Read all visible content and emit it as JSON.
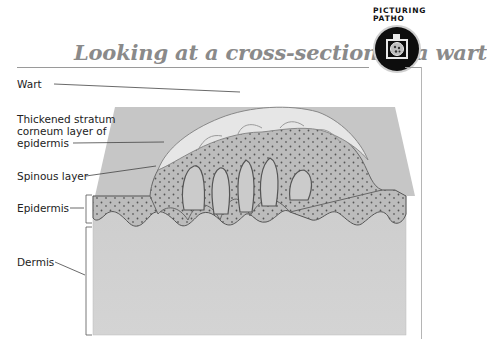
{
  "header": {
    "brand_line1": "PICTURING",
    "brand_line2": "PATHO",
    "title": "Looking at a cross-section of a wart",
    "badge_icon": "camera-icon"
  },
  "figure": {
    "labels": [
      {
        "id": "wart",
        "text": "Wart"
      },
      {
        "id": "stratum_line1",
        "text": "Thickened stratum"
      },
      {
        "id": "stratum_line2",
        "text": "corneum layer of"
      },
      {
        "id": "stratum_line3",
        "text": "epidermis"
      },
      {
        "id": "spinous",
        "text": "Spinous layer"
      },
      {
        "id": "epidermis",
        "text": "Epidermis"
      },
      {
        "id": "dermis",
        "text": "Dermis"
      }
    ],
    "colors": {
      "title_gray": "#8a8a8a",
      "dermis_fill": "#cfcfcf",
      "epidermis_fill": "#b9b9b9",
      "wart_cap": "#e4e4e4",
      "back_plane": "#c4c4c4"
    }
  }
}
